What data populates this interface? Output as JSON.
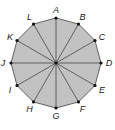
{
  "figure": {
    "type": "regular dodecagon divided into 12 triangles from center",
    "center": [
      56,
      63
    ],
    "radius": 45,
    "label_radius": 53,
    "fill_color": "#c2c2c2",
    "stroke_color": "#555555",
    "vertex_color": "#111111",
    "vertices": [
      {
        "label": "A",
        "angle_deg": -90
      },
      {
        "label": "B",
        "angle_deg": -60
      },
      {
        "label": "C",
        "angle_deg": -30
      },
      {
        "label": "D",
        "angle_deg": 0
      },
      {
        "label": "E",
        "angle_deg": 30
      },
      {
        "label": "F",
        "angle_deg": 60
      },
      {
        "label": "G",
        "angle_deg": 90
      },
      {
        "label": "H",
        "angle_deg": 120
      },
      {
        "label": "I",
        "angle_deg": 150
      },
      {
        "label": "J",
        "angle_deg": 180
      },
      {
        "label": "K",
        "angle_deg": 210
      },
      {
        "label": "L",
        "angle_deg": 240
      }
    ]
  }
}
